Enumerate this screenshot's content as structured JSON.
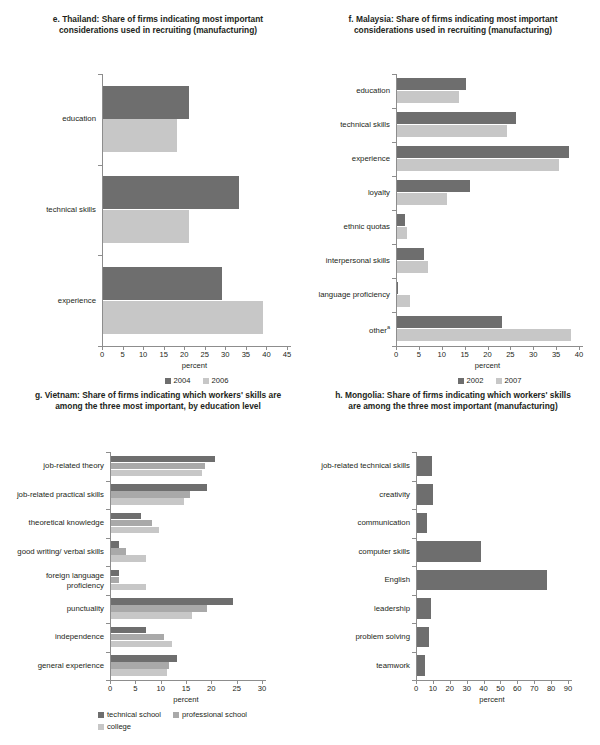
{
  "colors": {
    "dark": "#6e6e6e",
    "mid": "#a9a9a9",
    "light": "#c7c7c7",
    "axis": "#8d8d8d",
    "text": "#231f20"
  },
  "charts": [
    {
      "id": "thailand",
      "title": "e. Thailand: Share of firms indicating most important considerations used in recruiting (manufacturing)",
      "chart_data": {
        "type": "bar",
        "orientation": "horizontal",
        "title": "e. Thailand: Share of firms indicating most important considerations used in recruiting (manufacturing)",
        "categories": [
          "education",
          "technical skills",
          "experience"
        ],
        "series": [
          {
            "name": "2004",
            "color": "#6e6e6e",
            "values": [
              21,
              33,
              29
            ]
          },
          {
            "name": "2006",
            "color": "#c7c7c7",
            "values": [
              18,
              21,
              39
            ]
          }
        ],
        "xlabel": "percent",
        "ylabel": "",
        "xlim": [
          0,
          45
        ],
        "xticks": [
          0,
          5,
          10,
          15,
          20,
          25,
          30,
          35,
          40,
          45
        ],
        "grid": false,
        "legend_position": "bottom"
      }
    },
    {
      "id": "malaysia",
      "title": "f. Malaysia: Share of firms indicating most important considerations used in recruiting (manufacturing)",
      "chart_data": {
        "type": "bar",
        "orientation": "horizontal",
        "title": "f. Malaysia: Share of firms indicating most important considerations used in recruiting (manufacturing)",
        "categories": [
          "education",
          "technical skills",
          "experience",
          "loyalty",
          "ethnic quotas",
          "interpersonal skills",
          "language proficiency",
          "other"
        ],
        "category_notes": {
          "other": "a"
        },
        "series": [
          {
            "name": "2002",
            "color": "#6e6e6e",
            "values": [
              15,
              26,
              37.5,
              16,
              1.8,
              5.8,
              0.2,
              23
            ]
          },
          {
            "name": "2007",
            "color": "#c7c7c7",
            "values": [
              13.5,
              24,
              35.5,
              11,
              2.2,
              6.8,
              2.8,
              38
            ]
          }
        ],
        "xlabel": "percent",
        "ylabel": "",
        "xlim": [
          0,
          40
        ],
        "xticks": [
          0,
          5,
          10,
          15,
          20,
          25,
          30,
          35,
          40
        ],
        "grid": false,
        "legend_position": "bottom"
      }
    },
    {
      "id": "vietnam",
      "title": "g. Vietnam: Share of firms indicating which workers' skills are among the three most important, by education level",
      "chart_data": {
        "type": "bar",
        "orientation": "horizontal",
        "title": "g. Vietnam: Share of firms indicating which workers' skills are among the three most important, by education level",
        "categories": [
          "job-related theory",
          "job-related practical skills",
          "theoretical knowledge",
          "good writing/ verbal skills",
          "foreign language proficiency",
          "punctuality",
          "independence",
          "general experience"
        ],
        "series": [
          {
            "name": "technical school",
            "color": "#6e6e6e",
            "values": [
              20.5,
              19,
              6,
              1.6,
              1.5,
              24,
              7,
              13
            ]
          },
          {
            "name": "professional school",
            "color": "#a9a9a9",
            "values": [
              18.5,
              15.5,
              8,
              3,
              1.5,
              19,
              10.5,
              11.5
            ]
          },
          {
            "name": "college",
            "color": "#c7c7c7",
            "values": [
              18,
              14.5,
              9.5,
              7,
              7,
              16,
              12,
              11
            ]
          }
        ],
        "xlabel": "percent",
        "ylabel": "",
        "xlim": [
          0,
          30
        ],
        "xticks": [
          0,
          5,
          10,
          15,
          20,
          25,
          30
        ],
        "grid": false,
        "legend_position": "bottom"
      }
    },
    {
      "id": "mongolia",
      "title": "h. Mongolia: Share of firms indicating which workers' skills are among the three most important (manufacturing)",
      "chart_data": {
        "type": "bar",
        "orientation": "horizontal",
        "title": "h. Mongolia: Share of firms indicating which workers' skills are among the three most important (manufacturing)",
        "categories": [
          "job-related technical skills",
          "creativity",
          "communication",
          "computer skills",
          "English",
          "leadership",
          "problem solving",
          "teamwork"
        ],
        "series": [
          {
            "name": "share",
            "color": "#6e6e6e",
            "values": [
              9,
              9.5,
              6,
              38,
              77,
              8,
              7,
              5
            ]
          }
        ],
        "xlabel": "percent",
        "ylabel": "",
        "xlim": [
          0,
          90
        ],
        "xticks": [
          0,
          10,
          20,
          30,
          40,
          50,
          60,
          70,
          80,
          90
        ],
        "grid": false,
        "legend_position": "none"
      }
    }
  ]
}
